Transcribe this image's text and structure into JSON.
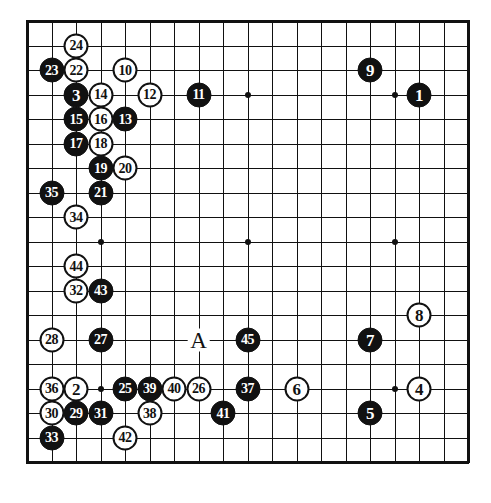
{
  "board": {
    "name": "go-game-record",
    "size": 19,
    "origin_x": 27,
    "origin_y": 21,
    "spacing": 24.5,
    "line_color": "#111111",
    "background_color": "#ffffff",
    "black_color": "#111111",
    "white_color": "#ffffff",
    "hoshi": [
      {
        "col": 3,
        "row": 3
      },
      {
        "col": 9,
        "row": 3
      },
      {
        "col": 15,
        "row": 3
      },
      {
        "col": 3,
        "row": 9
      },
      {
        "col": 9,
        "row": 9
      },
      {
        "col": 15,
        "row": 9
      },
      {
        "col": 3,
        "row": 15
      },
      {
        "col": 9,
        "row": 15
      },
      {
        "col": 15,
        "row": 15
      }
    ],
    "markers": [
      {
        "label": "A",
        "col": 7,
        "row": 13
      }
    ],
    "stones": [
      {
        "label": "1",
        "color": "black",
        "col": 16,
        "row": 3
      },
      {
        "label": "2",
        "color": "white",
        "col": 2,
        "row": 15
      },
      {
        "label": "3",
        "color": "black",
        "col": 2,
        "row": 3
      },
      {
        "label": "4",
        "color": "white",
        "col": 16,
        "row": 15
      },
      {
        "label": "5",
        "color": "black",
        "col": 14,
        "row": 16
      },
      {
        "label": "6",
        "color": "white",
        "col": 11,
        "row": 15
      },
      {
        "label": "7",
        "color": "black",
        "col": 14,
        "row": 13
      },
      {
        "label": "8",
        "color": "white",
        "col": 16,
        "row": 12
      },
      {
        "label": "9",
        "color": "black",
        "col": 14,
        "row": 2
      },
      {
        "label": "10",
        "color": "white",
        "col": 4,
        "row": 2
      },
      {
        "label": "11",
        "color": "black",
        "col": 7,
        "row": 3
      },
      {
        "label": "12",
        "color": "white",
        "col": 5,
        "row": 3
      },
      {
        "label": "13",
        "color": "black",
        "col": 4,
        "row": 4
      },
      {
        "label": "14",
        "color": "white",
        "col": 3,
        "row": 3
      },
      {
        "label": "15",
        "color": "black",
        "col": 2,
        "row": 4
      },
      {
        "label": "16",
        "color": "white",
        "col": 3,
        "row": 4
      },
      {
        "label": "17",
        "color": "black",
        "col": 2,
        "row": 5
      },
      {
        "label": "18",
        "color": "white",
        "col": 3,
        "row": 5
      },
      {
        "label": "19",
        "color": "black",
        "col": 3,
        "row": 6
      },
      {
        "label": "20",
        "color": "white",
        "col": 4,
        "row": 6
      },
      {
        "label": "21",
        "color": "black",
        "col": 3,
        "row": 7
      },
      {
        "label": "22",
        "color": "white",
        "col": 2,
        "row": 2
      },
      {
        "label": "23",
        "color": "black",
        "col": 1,
        "row": 2
      },
      {
        "label": "24",
        "color": "white",
        "col": 2,
        "row": 1
      },
      {
        "label": "25",
        "color": "black",
        "col": 4,
        "row": 15
      },
      {
        "label": "26",
        "color": "white",
        "col": 7,
        "row": 15
      },
      {
        "label": "27",
        "color": "black",
        "col": 3,
        "row": 13
      },
      {
        "label": "28",
        "color": "white",
        "col": 1,
        "row": 13
      },
      {
        "label": "29",
        "color": "black",
        "col": 2,
        "row": 16
      },
      {
        "label": "30",
        "color": "white",
        "col": 1,
        "row": 16
      },
      {
        "label": "31",
        "color": "black",
        "col": 3,
        "row": 16
      },
      {
        "label": "32",
        "color": "white",
        "col": 2,
        "row": 11
      },
      {
        "label": "33",
        "color": "black",
        "col": 1,
        "row": 17
      },
      {
        "label": "34",
        "color": "white",
        "col": 2,
        "row": 8
      },
      {
        "label": "35",
        "color": "black",
        "col": 1,
        "row": 7
      },
      {
        "label": "36",
        "color": "white",
        "col": 1,
        "row": 15
      },
      {
        "label": "37",
        "color": "black",
        "col": 9,
        "row": 15
      },
      {
        "label": "38",
        "color": "white",
        "col": 5,
        "row": 16
      },
      {
        "label": "39",
        "color": "black",
        "col": 5,
        "row": 15
      },
      {
        "label": "40",
        "color": "white",
        "col": 6,
        "row": 15
      },
      {
        "label": "41",
        "color": "black",
        "col": 8,
        "row": 16
      },
      {
        "label": "42",
        "color": "white",
        "col": 4,
        "row": 17
      },
      {
        "label": "43",
        "color": "black",
        "col": 3,
        "row": 11
      },
      {
        "label": "44",
        "color": "white",
        "col": 2,
        "row": 10
      },
      {
        "label": "45",
        "color": "black",
        "col": 9,
        "row": 13
      }
    ]
  }
}
